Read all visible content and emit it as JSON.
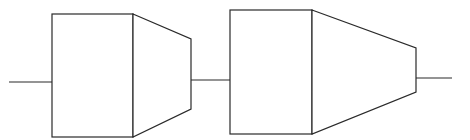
{
  "diagram": {
    "type": "block-chain",
    "stroke_color": "#2a2a2a",
    "background": "#ffffff",
    "input_line": {
      "x1": 9,
      "y1": 82,
      "x2": 52,
      "y2": 82
    },
    "stages": [
      {
        "rect": {
          "x": 52,
          "y": 14,
          "w": 81,
          "h": 123
        },
        "taper": {
          "x1": 133,
          "top1": 14,
          "bot1": 137,
          "x2": 191,
          "top2": 39,
          "bot2": 109
        }
      },
      {
        "rect": {
          "x": 230,
          "y": 10,
          "w": 82,
          "h": 124
        },
        "taper": {
          "x1": 312,
          "top1": 10,
          "bot1": 134,
          "x2": 416,
          "top2": 48,
          "bot2": 92
        }
      }
    ],
    "connector_line": {
      "x1": 191,
      "y1": 80,
      "x2": 230,
      "y2": 80
    },
    "output_line": {
      "x1": 416,
      "y1": 78,
      "x2": 452,
      "y2": 78
    }
  }
}
